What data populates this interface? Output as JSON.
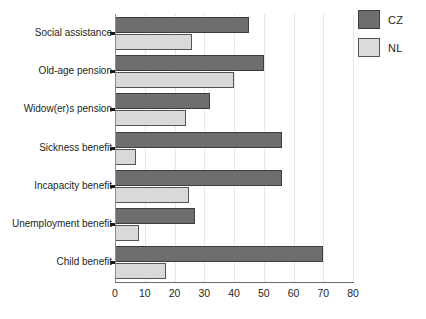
{
  "chart_data": {
    "type": "bar",
    "orientation": "horizontal",
    "title": "",
    "subtitle": "",
    "xlabel": "",
    "ylabel": "",
    "xlim": [
      0,
      80
    ],
    "xticks": [
      "0",
      "10",
      "20",
      "30",
      "40",
      "50",
      "60",
      "70",
      "80"
    ],
    "grid": "vertical",
    "legend_position": "top-right",
    "categories": [
      "Social assistance",
      "Old-age pension",
      "Widow(er)s pension",
      "Sickness benefit",
      "Incapacity benefit",
      "Unemployment benefit",
      "Child benefit"
    ],
    "series": [
      {
        "name": "CZ",
        "color": "#6e6e6e",
        "values": [
          45,
          50,
          32,
          56,
          56,
          27,
          70
        ]
      },
      {
        "name": "NL",
        "color": "#d9d9d9",
        "values": [
          26,
          40,
          24,
          7,
          25,
          8,
          17
        ]
      }
    ]
  },
  "legend": {
    "items": [
      {
        "label": "CZ",
        "series_key": "cz"
      },
      {
        "label": "NL",
        "series_key": "nl"
      }
    ]
  },
  "axis": {
    "x_min_label": "0",
    "x_max_label": "80"
  }
}
